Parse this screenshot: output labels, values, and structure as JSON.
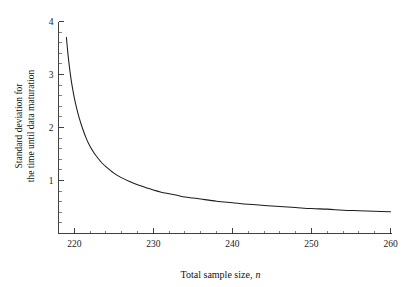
{
  "chart_data": {
    "type": "line",
    "title": "",
    "xlabel": "Total sample size, n",
    "xlabel_main": "Total sample size,",
    "xlabel_italic": "n",
    "ylabel": "Standard deviation for the time until data maturation",
    "ylabel_line1": "Standard deviation for",
    "ylabel_line2": "the time until data maturation",
    "xlim": [
      218,
      260
    ],
    "ylim": [
      0,
      4
    ],
    "x_ticks_major": [
      220,
      230,
      240,
      250,
      260
    ],
    "x_tick_labels": [
      "220",
      "230",
      "240",
      "250",
      "260"
    ],
    "x_ticks_minor": [
      222,
      224,
      226,
      228,
      232,
      234,
      236,
      238,
      242,
      244,
      246,
      248,
      252,
      254,
      256,
      258
    ],
    "y_ticks_major": [
      1,
      2,
      3,
      4
    ],
    "y_tick_labels": [
      "1",
      "2",
      "3",
      "4"
    ],
    "y_ticks_minor": [
      0.2,
      0.4,
      0.6,
      0.8,
      1.2,
      1.4,
      1.6,
      1.8,
      2.2,
      2.4,
      2.6,
      2.8,
      3.2,
      3.4,
      3.6,
      3.8
    ],
    "grid": false,
    "legend": null,
    "series": [
      {
        "name": "Standard deviation curve",
        "color": "#1c1c1c",
        "x": [
          219.0,
          219.2,
          219.4,
          219.6,
          219.8,
          220.0,
          220.3,
          220.6,
          221.0,
          221.5,
          222.0,
          222.5,
          223.0,
          223.5,
          224.0,
          225.0,
          226.0,
          227.0,
          228.0,
          229.0,
          230.0,
          231.0,
          232.0,
          233.0,
          234.0,
          235.0,
          236.0,
          238.0,
          240.0,
          242.0,
          244.0,
          246.0,
          248.0,
          250.0,
          252.0,
          254.0,
          256.0,
          258.0,
          260.0
        ],
        "y": [
          3.7,
          3.38,
          3.12,
          2.9,
          2.72,
          2.56,
          2.36,
          2.19,
          2.0,
          1.8,
          1.64,
          1.52,
          1.42,
          1.33,
          1.26,
          1.14,
          1.05,
          0.98,
          0.92,
          0.87,
          0.82,
          0.78,
          0.75,
          0.72,
          0.69,
          0.67,
          0.65,
          0.61,
          0.58,
          0.55,
          0.53,
          0.51,
          0.49,
          0.47,
          0.46,
          0.44,
          0.43,
          0.42,
          0.41
        ]
      }
    ]
  },
  "figure": {
    "background_color": "#ffffff",
    "axis_color": "#2b2b2b",
    "curve_color": "#1c1c1c"
  }
}
